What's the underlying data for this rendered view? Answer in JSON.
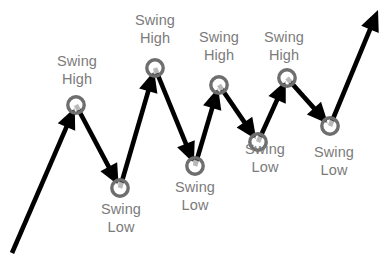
{
  "diagram": {
    "type": "market-structure-zigzag",
    "background_color": "#ffffff",
    "line_color": "#000000",
    "marker_ring_color": "#6e6e6e",
    "marker_fill_color": "#ffffff",
    "label_color": "#7b7b7b",
    "labels": [
      {
        "id": "swing-high-1",
        "line1": "Swing",
        "line2": "High",
        "kind": "high",
        "left": 48,
        "top": 52,
        "width": 58
      },
      {
        "id": "swing-low-1",
        "line1": "Swing",
        "line2": "Low",
        "kind": "low",
        "left": 92,
        "top": 200,
        "width": 58
      },
      {
        "id": "swing-high-2",
        "line1": "Swing",
        "line2": "High",
        "kind": "high",
        "left": 126,
        "top": 11,
        "width": 58
      },
      {
        "id": "swing-low-2",
        "line1": "Swing",
        "line2": "Low",
        "kind": "low",
        "left": 166,
        "top": 178,
        "width": 58
      },
      {
        "id": "swing-high-3",
        "line1": "Swing",
        "line2": "High",
        "kind": "high",
        "left": 190,
        "top": 28,
        "width": 58
      },
      {
        "id": "swing-low-3",
        "line1": "Swing",
        "line2": "Low",
        "kind": "low",
        "left": 236,
        "top": 140,
        "width": 58
      },
      {
        "id": "swing-high-4",
        "line1": "Swing",
        "line2": "High",
        "kind": "high",
        "left": 255,
        "top": 28,
        "width": 58
      },
      {
        "id": "swing-low-4",
        "line1": "Swing",
        "line2": "Low",
        "kind": "low",
        "left": 305,
        "top": 143,
        "width": 58
      }
    ]
  },
  "chart_data": {
    "type": "line",
    "title": "",
    "subtitle": "",
    "xlabel": "",
    "ylabel": "",
    "grid": false,
    "legend": "none",
    "xlim": [
      0,
      390
    ],
    "ylim": [
      0,
      257
    ],
    "note": "Coordinates are in screen pixel space; y increases downward.",
    "series": [
      {
        "name": "price-zigzag",
        "points": [
          {
            "x": 12,
            "y": 253,
            "label": "",
            "kind": "start"
          },
          {
            "x": 76,
            "y": 105,
            "label": "Swing High",
            "kind": "high"
          },
          {
            "x": 120,
            "y": 188,
            "label": "Swing Low",
            "kind": "low"
          },
          {
            "x": 155,
            "y": 68,
            "label": "Swing High",
            "kind": "high"
          },
          {
            "x": 195,
            "y": 166,
            "label": "Swing Low",
            "kind": "low"
          },
          {
            "x": 219,
            "y": 85,
            "label": "Swing High",
            "kind": "high"
          },
          {
            "x": 258,
            "y": 142,
            "label": "Swing Low",
            "kind": "low"
          },
          {
            "x": 287,
            "y": 78,
            "label": "Swing High",
            "kind": "high"
          },
          {
            "x": 330,
            "y": 126,
            "label": "Swing Low",
            "kind": "low"
          },
          {
            "x": 378,
            "y": 10,
            "label": "",
            "kind": "end"
          }
        ]
      }
    ],
    "annotations": [
      {
        "text": "Swing High",
        "x": 76,
        "y": 70
      },
      {
        "text": "Swing Low",
        "x": 120,
        "y": 218
      },
      {
        "text": "Swing High",
        "x": 155,
        "y": 30
      },
      {
        "text": "Swing Low",
        "x": 195,
        "y": 196
      },
      {
        "text": "Swing High",
        "x": 219,
        "y": 46
      },
      {
        "text": "Swing Low",
        "x": 265,
        "y": 158
      },
      {
        "text": "Swing High",
        "x": 284,
        "y": 46
      },
      {
        "text": "Swing Low",
        "x": 334,
        "y": 161
      }
    ]
  }
}
